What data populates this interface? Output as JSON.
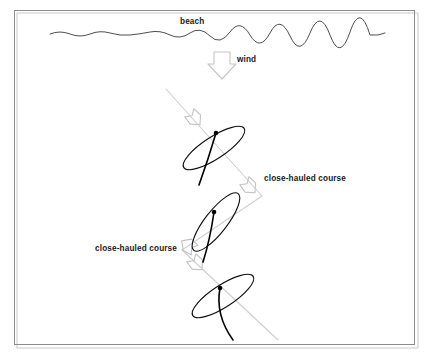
{
  "figure": {
    "type": "sailing-tacking-diagram",
    "width": 432,
    "height": 362,
    "background_color": "#ffffff",
    "frame": {
      "name": "diagram-border",
      "x": 14,
      "y": 10,
      "width": 401,
      "height": 335,
      "stroke_color": "#8c8c8c"
    }
  },
  "labels": {
    "beach": "beach",
    "wind": "wind",
    "close_hauled_right": "close-hauled course",
    "close_hauled_left": "close-hauled course"
  },
  "label_positions": {
    "beach": {
      "x": 180,
      "y": 24
    },
    "wind": {
      "x": 237,
      "y": 62
    },
    "close_hauled_right": {
      "x": 264,
      "y": 181
    },
    "close_hauled_left": {
      "x": 95,
      "y": 251
    }
  },
  "colors": {
    "ink": "#111111",
    "beach_line": "#3a3a3a",
    "course_gray": "#cfcfcf",
    "wind_gray": "#c6c6c6",
    "frame_gray": "#8c8c8c",
    "text": "#1a1a1a"
  },
  "shoreline": {
    "name": "beach-wavy-line",
    "path": "M 50 34 Q 60 30 70 34 T 90 34 T 110 33 T 130 35 T 150 32 T 170 35 T 190 33 T 210 36 T 230 32 T 250 35 T 270 33 T 290 36 T 310 33 T 330 35 T 350 32 T 370 35 Q 378 36 385 33"
  },
  "wind_arrow": {
    "name": "wind-direction-arrow",
    "direction": "down",
    "path": "M 214 52 L 230 52 L 230 64 L 236 64 L 222 79 L 208 64 L 214 64 Z",
    "color": "#c6c6c6"
  },
  "course_path": {
    "name": "close-hauled-zigzag-course",
    "description": "gray zigzag tacking course running from upper-left down to lower-right",
    "segments": [
      {
        "x1": 166,
        "y1": 89,
        "x2": 262,
        "y2": 196
      },
      {
        "x1": 262,
        "y1": 196,
        "x2": 182,
        "y2": 250
      },
      {
        "x1": 182,
        "y1": 250,
        "x2": 278,
        "y2": 340
      }
    ]
  },
  "course_arrowheads": [
    {
      "name": "course-arrowhead-1",
      "cx": 194,
      "cy": 118,
      "angle": 48
    },
    {
      "name": "course-arrowhead-2",
      "cx": 249,
      "cy": 186,
      "angle": 48
    },
    {
      "name": "course-arrowhead-3",
      "cx": 189,
      "cy": 246,
      "angle": 215
    },
    {
      "name": "course-arrowhead-4",
      "cx": 196,
      "cy": 263,
      "angle": 48
    }
  ],
  "boats": [
    {
      "name": "sailboat-top",
      "cx": 214,
      "cy": 148,
      "rx": 36,
      "ry": 11,
      "rotation": -33,
      "mast": {
        "x": 216,
        "y": 133
      },
      "sail_path": "M 216 133 Q 208 160 199 185"
    },
    {
      "name": "sailboat-middle",
      "cx": 216,
      "cy": 222,
      "rx": 36,
      "ry": 11,
      "rotation": -52,
      "mast": {
        "x": 214,
        "y": 212
      },
      "sail_path": "M 214 212 Q 210 240 203 262"
    },
    {
      "name": "sailboat-bottom",
      "cx": 223,
      "cy": 296,
      "rx": 36,
      "ry": 11,
      "rotation": -33,
      "mast": {
        "x": 220,
        "y": 288
      },
      "sail_path": "M 220 288 Q 215 315 233 340"
    }
  ]
}
